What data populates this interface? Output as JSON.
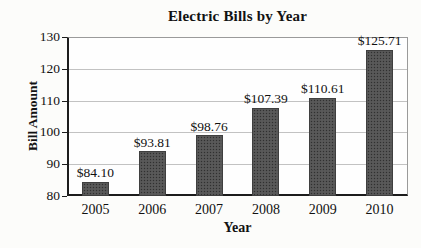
{
  "chart_data": {
    "type": "bar",
    "title": "Electric Bills by Year",
    "xlabel": "Year",
    "ylabel": "Bill Amount",
    "categories": [
      "2005",
      "2006",
      "2007",
      "2008",
      "2009",
      "2010"
    ],
    "values": [
      84.1,
      93.81,
      98.76,
      107.39,
      110.61,
      125.71
    ],
    "value_labels": [
      "$84.10",
      "$93.81",
      "$98.76",
      "$107.39",
      "$110.61",
      "$125.71"
    ],
    "ylim": [
      80,
      130
    ],
    "yticks": [
      80,
      90,
      100,
      110,
      120,
      130
    ],
    "grid": true,
    "legend": false,
    "bar_color": "#545454",
    "gridline_color": "#c2c2c2"
  }
}
